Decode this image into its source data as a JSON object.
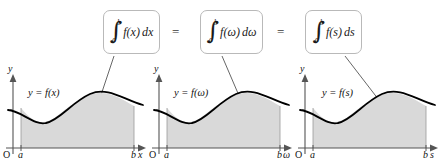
{
  "figure": {
    "equals_1": "=",
    "equals_2": "="
  },
  "formulas": [
    {
      "id": "formula-x",
      "integral_sign": "∫",
      "lower_limit": "a",
      "upper_limit": "b",
      "integrand": "f(x)",
      "differential": "dx"
    },
    {
      "id": "formula-omega",
      "integral_sign": "∫",
      "lower_limit": "a",
      "upper_limit": "b",
      "integrand": "f(ω)",
      "differential": "dω"
    },
    {
      "id": "formula-s",
      "integral_sign": "∫",
      "lower_limit": "a",
      "upper_limit": "b",
      "integrand": "f(s)",
      "differential": "ds"
    }
  ],
  "panels": [
    {
      "id": "panel-x",
      "y_axis_label": "y",
      "x_axis_label": "x",
      "origin_label": "O",
      "lower_bound_label": "a",
      "upper_bound_label": "b",
      "curve_label": "y = f(x)"
    },
    {
      "id": "panel-omega",
      "y_axis_label": "y",
      "x_axis_label": "ω",
      "origin_label": "O",
      "lower_bound_label": "a",
      "upper_bound_label": "b",
      "curve_label": "y = f(ω)"
    },
    {
      "id": "panel-s",
      "y_axis_label": "y",
      "x_axis_label": "s",
      "origin_label": "O",
      "lower_bound_label": "a",
      "upper_bound_label": "b",
      "curve_label": "y = f(s)"
    }
  ],
  "colors": {
    "shaded_region": "#d9d9d9",
    "curve": "#000000",
    "axis": "#555555",
    "box_border": "#b9b9b9",
    "leader_line": "#444444",
    "background": "#ffffff"
  }
}
